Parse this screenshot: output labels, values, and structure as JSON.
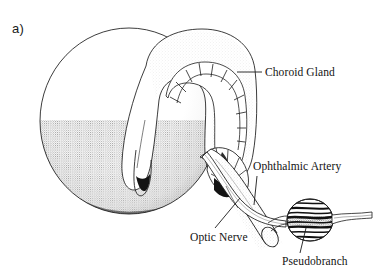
{
  "figure": {
    "panel_label": "a)",
    "background_color": "#ffffff",
    "ink_color": "#101010",
    "width": 377,
    "height": 276,
    "style": "pen-and-ink stipple line drawing"
  },
  "labels": [
    {
      "id": "choroid-gland",
      "text": "Choroid Gland",
      "leader": "horizontal",
      "leader_from": [
        263,
        72
      ],
      "leader_to": [
        237,
        72
      ],
      "anchor": [
        232,
        74
      ]
    },
    {
      "id": "ophthalmic-artery",
      "text": "Ophthalmic Artery",
      "leader": "vertical",
      "leader_from": [
        257,
        175
      ],
      "leader_to": [
        254,
        204
      ],
      "anchor": [
        254,
        206
      ]
    },
    {
      "id": "optic-nerve",
      "text": "Optic Nerve",
      "leader": "diagonal",
      "leader_from": [
        238,
        200
      ],
      "leader_to": [
        213,
        229
      ],
      "anchor": [
        240,
        198
      ]
    },
    {
      "id": "pseudobranch",
      "text": "Pseudobranch",
      "leader": "diagonal",
      "leader_from": [
        300,
        252
      ],
      "leader_to": [
        305,
        228
      ],
      "anchor": [
        306,
        226
      ]
    }
  ],
  "structures": [
    {
      "id": "eyeball",
      "name": "Eyeball sphere",
      "shading": "stippled lower-left"
    },
    {
      "id": "choroid-gland",
      "name": "Choroid Gland",
      "shape": "horseshoe / U-shaped segmented band",
      "segments": 12
    },
    {
      "id": "optic-nerve",
      "name": "Optic Nerve",
      "shape": "thick cut tube with elliptical cut face"
    },
    {
      "id": "ophthalmic-artery",
      "name": "Ophthalmic Artery",
      "shape": "slender tube running to pseudobranch"
    },
    {
      "id": "pseudobranch",
      "name": "Pseudobranch",
      "shape": "ovoid body with horizontal lamellae striations"
    }
  ]
}
